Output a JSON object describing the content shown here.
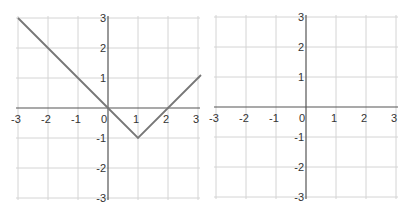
{
  "chart_data": [
    {
      "type": "line",
      "title": "",
      "xlabel": "",
      "ylabel": "",
      "xlim": [
        -3,
        3
      ],
      "ylim": [
        -3,
        3
      ],
      "grid": true,
      "x_ticks": [
        -3,
        -2,
        -1,
        0,
        1,
        2,
        3
      ],
      "y_ticks": [
        3,
        2,
        1,
        -1,
        -2,
        -3
      ],
      "series": [
        {
          "name": "piecewise",
          "x": [
            -3,
            0,
            1,
            3.1
          ],
          "y": [
            3,
            0,
            -1,
            1.1
          ],
          "color": "#777777"
        }
      ]
    },
    {
      "type": "line",
      "title": "",
      "xlabel": "",
      "ylabel": "",
      "xlim": [
        -3,
        3
      ],
      "ylim": [
        -3,
        3
      ],
      "grid": true,
      "x_ticks": [
        -3,
        -2,
        -1,
        0,
        1,
        2,
        3
      ],
      "y_ticks": [
        3,
        2,
        1,
        -1,
        -2,
        -3
      ],
      "series": []
    }
  ],
  "graphs": [
    {
      "origin_x": 108,
      "origin_y": 108,
      "unit": 30
    },
    {
      "origin_x": 306,
      "origin_y": 107,
      "unit": 30
    }
  ]
}
